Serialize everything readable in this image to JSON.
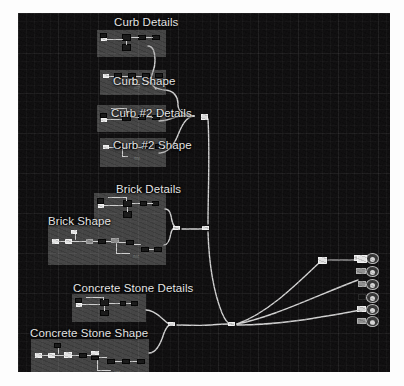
{
  "app": {
    "kind": "node-graph-editor",
    "canvas_background": "#100f10",
    "grid_line_color": "#2a2a2a",
    "wire_color": "#d6d6d6",
    "group_box_color": "#969696",
    "title_text_color": "#e9e9e9"
  },
  "groups": [
    {
      "id": "curb-details",
      "title": "Curb Details",
      "box": {
        "x": 79,
        "y": 17,
        "w": 69,
        "h": 27
      }
    },
    {
      "id": "curb-shape",
      "title": "Curb Shape",
      "box": {
        "x": 82,
        "y": 57,
        "w": 66,
        "h": 25
      }
    },
    {
      "id": "curb-2-details",
      "title": "Curb #2 Details",
      "box": {
        "x": 79,
        "y": 92,
        "w": 69,
        "h": 27
      }
    },
    {
      "id": "curb-2-shape",
      "title": "Curb #2 Shape",
      "box": {
        "x": 82,
        "y": 125,
        "w": 66,
        "h": 29
      }
    },
    {
      "id": "brick-details",
      "title": "Brick Details",
      "box": {
        "x": 76,
        "y": 180,
        "w": 72,
        "h": 32
      }
    },
    {
      "id": "brick-shape",
      "title": "Brick Shape",
      "box": {
        "x": 30,
        "y": 212,
        "w": 118,
        "h": 40
      }
    },
    {
      "id": "concrete-stone-details",
      "title": "Concrete Stone Details",
      "box": {
        "x": 54,
        "y": 281,
        "w": 74,
        "h": 28
      }
    },
    {
      "id": "concrete-stone-shape",
      "title": "Concrete Stone Shape",
      "box": {
        "x": 13,
        "y": 326,
        "w": 118,
        "h": 40
      }
    }
  ],
  "reroutes": [
    {
      "id": "reroute-brick-join",
      "x": 157,
      "y": 215
    },
    {
      "id": "reroute-curb-join",
      "x": 186,
      "y": 215
    },
    {
      "id": "reroute-curb-top",
      "x": 185,
      "y": 103
    },
    {
      "id": "reroute-concrete-in",
      "x": 152,
      "y": 311
    },
    {
      "id": "reroute-main-out",
      "x": 212,
      "y": 311
    }
  ],
  "output_node": {
    "id": "material-output",
    "pin_count": 6,
    "pins": [
      {
        "index": 0,
        "state": "connected"
      },
      {
        "index": 1,
        "state": "connected"
      },
      {
        "index": 2,
        "state": "connected"
      },
      {
        "index": 3,
        "state": "empty"
      },
      {
        "index": 4,
        "state": "connected"
      },
      {
        "index": 5,
        "state": "connected"
      }
    ]
  }
}
